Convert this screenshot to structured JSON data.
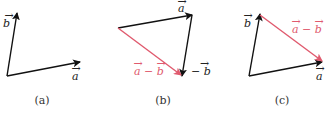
{
  "colors": {
    "vector": "#111111",
    "difference": "#e05a6e"
  },
  "panels": [
    {
      "caption": "(a)",
      "labels": {
        "a": "a",
        "b": "b"
      }
    },
    {
      "caption": "(b)",
      "labels": {
        "a": "a",
        "neg_b": "− b",
        "diff": "a − b"
      }
    },
    {
      "caption": "(c)",
      "labels": {
        "a": "a",
        "b": "b",
        "diff": "a − b"
      }
    }
  ]
}
